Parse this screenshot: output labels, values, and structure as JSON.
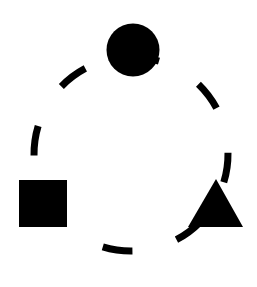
{
  "figure": {
    "background_color": "#ffffff",
    "ink_color": "#000000",
    "canvas": {
      "width": 257,
      "height": 287
    },
    "dashed_circle": {
      "name": "dashed-circle-path",
      "center_x": 131,
      "center_y": 154,
      "radius": 97,
      "stroke_width": 7,
      "stroke_color": "#000000",
      "dash_pattern": "30 46",
      "dash_offset": 62,
      "rotation_deg": -9,
      "visible_dash_count": 6
    },
    "shapes": [
      {
        "name": "circle-shape",
        "kind": "circle",
        "label": "circle",
        "fill": "#000000",
        "center_x": 133,
        "center_y": 50,
        "radius": 26.5
      },
      {
        "name": "square-shape",
        "kind": "square",
        "label": "square",
        "fill": "#000000",
        "x": 19,
        "y": 180,
        "width": 48,
        "height": 47
      },
      {
        "name": "triangle-shape",
        "kind": "triangle",
        "label": "triangle",
        "fill": "#000000",
        "apex_x": 216,
        "apex_y": 179,
        "base_left_x": 188,
        "base_right_x": 243,
        "base_y": 227,
        "points": "216,179 243,227 188,227"
      }
    ]
  }
}
